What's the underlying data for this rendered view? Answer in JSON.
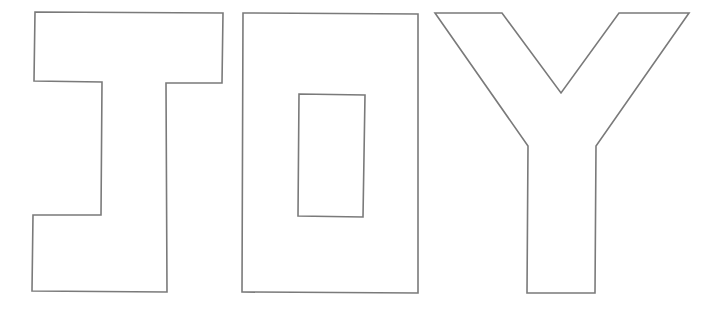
{
  "title": "Letter outlines",
  "word": "IOY",
  "letters": [
    {
      "char": "I",
      "style": "outline"
    },
    {
      "char": "O",
      "style": "outline"
    },
    {
      "char": "Y",
      "style": "outline"
    }
  ],
  "colors": {
    "background": "#ffffff",
    "stroke": "#7a7a7a"
  }
}
